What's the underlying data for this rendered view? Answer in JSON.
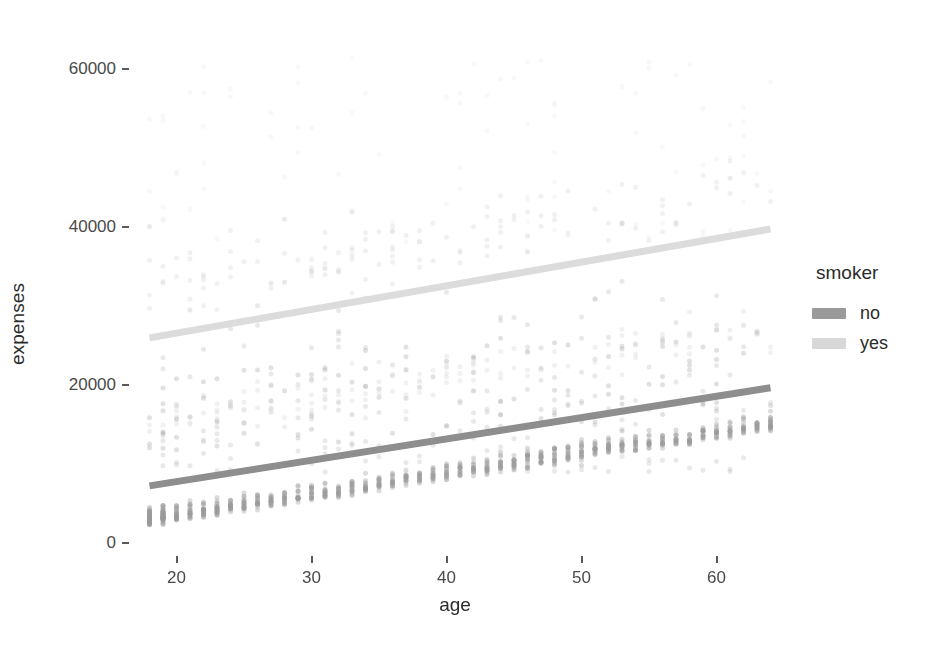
{
  "chart_data": {
    "type": "scatter",
    "title": "",
    "xlabel": "age",
    "ylabel": "expenses",
    "xlim": [
      17,
      65
    ],
    "ylim": [
      -1500,
      65000
    ],
    "xticks": [
      20,
      30,
      40,
      50,
      60
    ],
    "yticks": [
      0,
      20000,
      40000,
      60000
    ],
    "xtick_labels": [
      "20",
      "30",
      "40",
      "50",
      "60"
    ],
    "ytick_labels": [
      "0",
      "20000",
      "40000",
      "60000"
    ],
    "grid": false,
    "legend": {
      "title": "smoker",
      "position": "right",
      "entries": [
        {
          "label": "no",
          "color": "#9a9a9a"
        },
        {
          "label": "yes",
          "color": "#d8d8d8"
        }
      ]
    },
    "series": [
      {
        "name": "no",
        "color": "#9a9a9a",
        "point_alpha": 0.35,
        "point_size": 5,
        "fit": {
          "type": "linear",
          "intercept": 2400,
          "slope": 270,
          "x0": 18,
          "x1": 64,
          "y0": 7260,
          "y1": 19680,
          "color": "#8e8e8e",
          "width": 7
        },
        "x": [
          18,
          18,
          18,
          18,
          18,
          18,
          18,
          18,
          18,
          18,
          18,
          18,
          18,
          18,
          18,
          18,
          18,
          18,
          18,
          18,
          18,
          18,
          18,
          18,
          18,
          18,
          18,
          18,
          18,
          18,
          18,
          18,
          18,
          18,
          18,
          18,
          18,
          18,
          18,
          18,
          18,
          18,
          18,
          18,
          18,
          18,
          18,
          18,
          18,
          18,
          18,
          18,
          18,
          18,
          18,
          18,
          18,
          18,
          18,
          18,
          19,
          19,
          19,
          19,
          19,
          19,
          19,
          19,
          19,
          19,
          19,
          19,
          19,
          19,
          19,
          19,
          19,
          19,
          19,
          19,
          19,
          19,
          19,
          19,
          19,
          19,
          19,
          19,
          19,
          19,
          19,
          19,
          19,
          19,
          19,
          19,
          19,
          19,
          19,
          19,
          19,
          19,
          19,
          19,
          19,
          19,
          19,
          19,
          19,
          19,
          19,
          19,
          19,
          19,
          19,
          19,
          19,
          19,
          19,
          19,
          20,
          20,
          20,
          20,
          20,
          20,
          20,
          20,
          20,
          20,
          20,
          20,
          20,
          20,
          20,
          20,
          20,
          20,
          20,
          20,
          20,
          20,
          20,
          20,
          20,
          20,
          20,
          20,
          21,
          21,
          21,
          21,
          21,
          21,
          21,
          21,
          21,
          21,
          21,
          21,
          21,
          21,
          21,
          21,
          21,
          21,
          21,
          21,
          21,
          21,
          21,
          21,
          22,
          22,
          22,
          22,
          22,
          22,
          22,
          22,
          22,
          22,
          22,
          22,
          22,
          22,
          22,
          22,
          22,
          22,
          22,
          22,
          22,
          22,
          22,
          22,
          22,
          23,
          23,
          23,
          23,
          23,
          23,
          23,
          23,
          23,
          23,
          23,
          23,
          23,
          23,
          23,
          23,
          23,
          23,
          23,
          23,
          23,
          23,
          23,
          23,
          23,
          23,
          24,
          24,
          24,
          24,
          24,
          24,
          24,
          24,
          24,
          24,
          24,
          24,
          24,
          24,
          24,
          24,
          24,
          24,
          24,
          24,
          24,
          24,
          24,
          25,
          25,
          25,
          25,
          25,
          25,
          25,
          25,
          25,
          25,
          25,
          25,
          25,
          25,
          25,
          25,
          25,
          25,
          25,
          25,
          25,
          25,
          26,
          26,
          26,
          26,
          26,
          26,
          26,
          26,
          26,
          26,
          26,
          26,
          26,
          26,
          26,
          26,
          26,
          26,
          26,
          26,
          27,
          27,
          27,
          27,
          27,
          27,
          27,
          27,
          27,
          27,
          27,
          27,
          27,
          27,
          27,
          27,
          27,
          27,
          27,
          27,
          28,
          28,
          28,
          28,
          28,
          28,
          28,
          28,
          28,
          28,
          28,
          28,
          28,
          28,
          28,
          28,
          28,
          28,
          28,
          28,
          29,
          29,
          29,
          29,
          29,
          29,
          29,
          29,
          29,
          29,
          29,
          29,
          29,
          29,
          29,
          29,
          29,
          29,
          30,
          30,
          30,
          30,
          30,
          30,
          30,
          30,
          30,
          30,
          30,
          30,
          30,
          30,
          30,
          30,
          30,
          30,
          30,
          30,
          31,
          31,
          31,
          31,
          31,
          31,
          31,
          31,
          31,
          31,
          31,
          31,
          31,
          31,
          31,
          31,
          31,
          31,
          31,
          32,
          32,
          32,
          32,
          32,
          32,
          32,
          32,
          32,
          32,
          32,
          32,
          32,
          32,
          32,
          32,
          32,
          32,
          33,
          33,
          33,
          33,
          33,
          33,
          33,
          33,
          33,
          33,
          33,
          33,
          33,
          33,
          33,
          33,
          33,
          33,
          33,
          34,
          34,
          34,
          34,
          34,
          34,
          34,
          34,
          34,
          34,
          34,
          34,
          34,
          34,
          34,
          34,
          34,
          34,
          34,
          35,
          35,
          35,
          35,
          35,
          35,
          35,
          35,
          35,
          35,
          35,
          35,
          35,
          35,
          35,
          35,
          35,
          36,
          36,
          36,
          36,
          36,
          36,
          36,
          36,
          36,
          36,
          36,
          36,
          36,
          36,
          36,
          36,
          36,
          37,
          37,
          37,
          37,
          37,
          37,
          37,
          37,
          37,
          37,
          37,
          37,
          37,
          37,
          37,
          37,
          38,
          38,
          38,
          38,
          38,
          38,
          38,
          38,
          38,
          38,
          38,
          38,
          38,
          38,
          38,
          38,
          39,
          39,
          39,
          39,
          39,
          39,
          39,
          39,
          39,
          39,
          39,
          39,
          39,
          39,
          39,
          39,
          39,
          40,
          40,
          40,
          40,
          40,
          40,
          40,
          40,
          40,
          40,
          40,
          40,
          40,
          40,
          40,
          40,
          40,
          40,
          41,
          41,
          41,
          41,
          41,
          41,
          41,
          41,
          41,
          41,
          41,
          41,
          41,
          41,
          41,
          41,
          41,
          42,
          42,
          42,
          42,
          42,
          42,
          42,
          42,
          42,
          42,
          42,
          42,
          42,
          42,
          42,
          42,
          42,
          43,
          43,
          43,
          43,
          43,
          43,
          43,
          43,
          43,
          43,
          43,
          43,
          43,
          43,
          43,
          43,
          43,
          43,
          44,
          44,
          44,
          44,
          44,
          44,
          44,
          44,
          44,
          44,
          44,
          44,
          44,
          44,
          44,
          44,
          44,
          45,
          45,
          45,
          45,
          45,
          45,
          45,
          45,
          45,
          45,
          45,
          45,
          45,
          45,
          45,
          45,
          45,
          45,
          45,
          46,
          46,
          46,
          46,
          46,
          46,
          46,
          46,
          46,
          46,
          46,
          46,
          46,
          46,
          46,
          46,
          46,
          46,
          46,
          47,
          47,
          47,
          47,
          47,
          47,
          47,
          47,
          47,
          47,
          47,
          47,
          47,
          47,
          47,
          47,
          47,
          47,
          48,
          48,
          48,
          48,
          48,
          48,
          48,
          48,
          48,
          48,
          48,
          48,
          48,
          48,
          48,
          48,
          48,
          48,
          48,
          49,
          49,
          49,
          49,
          49,
          49,
          49,
          49,
          49,
          49,
          49,
          49,
          49,
          49,
          49,
          49,
          49,
          50,
          50,
          50,
          50,
          50,
          50,
          50,
          50,
          50,
          50,
          50,
          50,
          50,
          50,
          50,
          50,
          50,
          50,
          50,
          51,
          51,
          51,
          51,
          51,
          51,
          51,
          51,
          51,
          51,
          51,
          51,
          51,
          51,
          51,
          51,
          51,
          51,
          52,
          52,
          52,
          52,
          52,
          52,
          52,
          52,
          52,
          52,
          52,
          52,
          52,
          52,
          52,
          52,
          52,
          52,
          52,
          53,
          53,
          53,
          53,
          53,
          53,
          53,
          53,
          53,
          53,
          53,
          53,
          53,
          53,
          53,
          53,
          53,
          53,
          54,
          54,
          54,
          54,
          54,
          54,
          54,
          54,
          54,
          54,
          54,
          54,
          54,
          54,
          54,
          54,
          54,
          54,
          55,
          55,
          55,
          55,
          55,
          55,
          55,
          55,
          55,
          55,
          55,
          55,
          55,
          55,
          55,
          55,
          56,
          56,
          56,
          56,
          56,
          56,
          56,
          56,
          56,
          56,
          56,
          56,
          56,
          56,
          56,
          56,
          57,
          57,
          57,
          57,
          57,
          57,
          57,
          57,
          57,
          57,
          57,
          57,
          57,
          57,
          57,
          57,
          58,
          58,
          58,
          58,
          58,
          58,
          58,
          58,
          58,
          58,
          58,
          58,
          58,
          58,
          58,
          58,
          59,
          59,
          59,
          59,
          59,
          59,
          59,
          59,
          59,
          59,
          59,
          59,
          59,
          59,
          59,
          59,
          59,
          60,
          60,
          60,
          60,
          60,
          60,
          60,
          60,
          60,
          60,
          60,
          60,
          60,
          60,
          60,
          60,
          60,
          61,
          61,
          61,
          61,
          61,
          61,
          61,
          61,
          61,
          61,
          61,
          61,
          61,
          61,
          61,
          61,
          62,
          62,
          62,
          62,
          62,
          62,
          62,
          62,
          62,
          62,
          62,
          62,
          62,
          62,
          62,
          62,
          62,
          62,
          63,
          63,
          63,
          63,
          63,
          63,
          63,
          63,
          63,
          63,
          63,
          63,
          63,
          63,
          63,
          63,
          63,
          64,
          64,
          64,
          64,
          64,
          64,
          64,
          64,
          64,
          64,
          64,
          64,
          64,
          64,
          64,
          64,
          64,
          64,
          64,
          64,
          64,
          64
        ]
      },
      {
        "name": "yes",
        "color": "#d2d2d2",
        "point_alpha": 0.3,
        "point_size": 5,
        "fit": {
          "type": "linear",
          "intercept": 20600,
          "slope": 300,
          "x0": 18,
          "x1": 64,
          "y0": 26000,
          "y1": 39800,
          "color": "#dcdcdc",
          "width": 7
        }
      }
    ]
  },
  "axes": {
    "y_title": "expenses",
    "x_title": "age"
  },
  "legend": {
    "title": "smoker",
    "items": [
      {
        "label": "no",
        "color": "#9a9a9a"
      },
      {
        "label": "yes",
        "color": "#d8d8d8"
      }
    ]
  }
}
